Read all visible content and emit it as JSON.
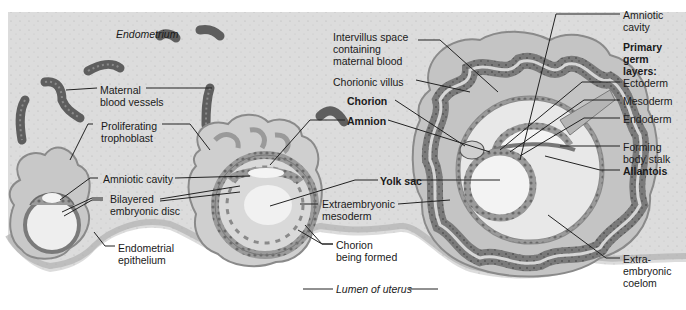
{
  "figure": {
    "type": "labeled illustration",
    "colors": {
      "endometrium": "#dedede",
      "endometrium_dark": "#cfcfcf",
      "trophoblast": "#b8b8b8",
      "villus_dark": "#6e6e6e",
      "vessel": "#5e5e5e",
      "cavity": "#f2f2f2",
      "lumen": "#ffffff",
      "leader_line": "#222222"
    }
  },
  "region_labels": {
    "endometrium": "Endometrium",
    "lumen": "Lumen of uterus"
  },
  "labels_left": {
    "maternal_blood_vessels": "Maternal\nblood vessels",
    "proliferating_trophoblast": "Proliferating\ntrophoblast",
    "amniotic_cavity": "Amniotic cavity",
    "bilayered_disc": "Bilayered\nembryonic disc",
    "endometrial_epithelium": "Endometrial\nepithelium"
  },
  "labels_middle": {
    "intervillus_space": "Intervillus space\ncontaining\nmaternal blood",
    "chorionic_villus": "Chorionic villus",
    "chorion": "Chorion",
    "amnion": "Amnion",
    "yolk_sac": "Yolk sac",
    "extraembryonic_mesoderm": "Extraembryonic\nmesoderm",
    "chorion_being_formed": "Chorion\nbeing formed"
  },
  "labels_right": {
    "amniotic_cavity": "Amniotic\ncavity",
    "primary_germ_layers": "Primary\ngerm\nlayers:",
    "ectoderm": "Ectoderm",
    "mesoderm": "Mesoderm",
    "endoderm": "Endoderm",
    "forming_body_stalk": "Forming\nbody stalk",
    "allantois": "Allantois",
    "extraembryonic_coelom": "Extra-\nembryonic\ncoelom"
  }
}
